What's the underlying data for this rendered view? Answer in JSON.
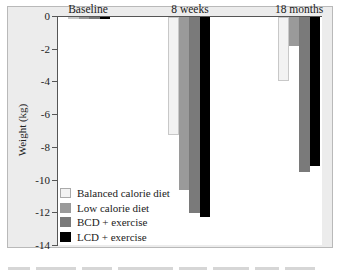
{
  "chart_data": {
    "type": "bar",
    "title": "",
    "xlabel": "",
    "ylabel": "Weight (kg)",
    "ylim": [
      -14,
      0
    ],
    "yticks": [
      0,
      -2,
      -4,
      -6,
      -8,
      -10,
      -12,
      -14
    ],
    "ytick_labels": [
      "0",
      "-2",
      "-4",
      "-6",
      "-8",
      "-10",
      "-12",
      "-14"
    ],
    "categories": [
      "Baseline",
      "8 weeks",
      "18 months"
    ],
    "category_position": "top",
    "grid": false,
    "legend_position": "lower-left-inside",
    "series": [
      {
        "name": "Balanced calorie diet",
        "color": "#f2f2f2",
        "values": [
          0,
          -7.2,
          -3.9
        ]
      },
      {
        "name": "Low calorie diet",
        "color": "#9a9a9a",
        "values": [
          0,
          -10.6,
          -1.8
        ]
      },
      {
        "name": "BCD + exercise",
        "color": "#7a7a7a",
        "values": [
          0,
          -12.0,
          -9.5
        ]
      },
      {
        "name": "LCD + exercise",
        "color": "#000000",
        "values": [
          0,
          -12.2,
          -9.1
        ]
      }
    ]
  },
  "labels": {
    "ylabel": "Weight (kg)",
    "categories": [
      "Baseline",
      "8 weeks",
      "18 months"
    ],
    "ticks": [
      "0",
      "-2",
      "-4",
      "-6",
      "-8",
      "-10",
      "-12",
      "-14"
    ],
    "legend": [
      "Balanced calorie diet",
      "Low calorie diet",
      "BCD + exercise",
      "LCD + exercise"
    ]
  }
}
